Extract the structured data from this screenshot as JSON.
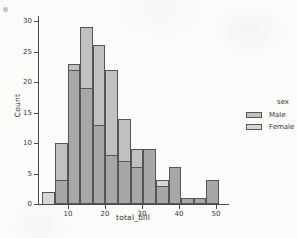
{
  "figure": {
    "background": "#fbfbfa"
  },
  "axes": {
    "x": {
      "label": "total_bill",
      "ticks": [
        10,
        20,
        30,
        40,
        50
      ]
    },
    "y": {
      "label": "Count",
      "ticks": [
        0,
        5,
        10,
        15,
        20,
        25,
        30
      ]
    }
  },
  "legend": {
    "title": "sex",
    "entries": [
      {
        "label": "Male",
        "fill": "#c0c0be"
      },
      {
        "label": "Female",
        "fill": "#d6d6d4"
      }
    ]
  },
  "colors": {
    "male_fill": "#c0c0be",
    "female_fill": "#d6d6d4",
    "overlap_fill": "#a7a7a5",
    "edge": "#54555a",
    "axis": "#4a4a4a",
    "text": "#3a3a3a"
  },
  "chart_data": {
    "type": "bar",
    "subtype": "histogram",
    "multiple": "layer",
    "title": "",
    "xlabel": "total_bill",
    "ylabel": "Count",
    "xlim": [
      0,
      53
    ],
    "ylim": [
      0,
      30
    ],
    "grid": false,
    "legend_position": "right",
    "bin_edges": [
      3.07,
      6.48,
      9.89,
      13.3,
      16.71,
      20.12,
      23.53,
      26.94,
      30.35,
      33.76,
      37.17,
      40.58,
      43.99,
      47.4,
      50.81
    ],
    "series": [
      {
        "name": "Male",
        "values": [
          0,
          10,
          23,
          29,
          26,
          22,
          14,
          9,
          9,
          3,
          6,
          1,
          1,
          4
        ]
      },
      {
        "name": "Female",
        "values": [
          2,
          4,
          22,
          19,
          13,
          8,
          7,
          6,
          9,
          4,
          6,
          1,
          1,
          4
        ]
      }
    ]
  }
}
